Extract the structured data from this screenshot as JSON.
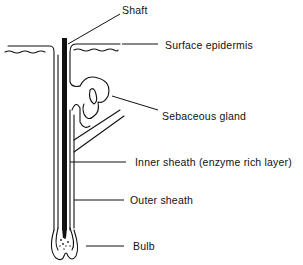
{
  "diagram": {
    "type": "anatomical-cross-section",
    "labels": [
      {
        "id": "shaft",
        "text": "Shaft",
        "x": 122,
        "y": 4
      },
      {
        "id": "surface-epidermis",
        "text": "Surface epidermis",
        "x": 165,
        "y": 39
      },
      {
        "id": "sebaceous-gland",
        "text": "Sebaceous gland",
        "x": 162,
        "y": 110
      },
      {
        "id": "inner-sheath",
        "text": "Inner sheath (enzyme rich layer)",
        "x": 135,
        "y": 155
      },
      {
        "id": "outer-sheath",
        "text": "Outer sheath",
        "x": 130,
        "y": 192
      },
      {
        "id": "bulb",
        "text": "Bulb",
        "x": 133,
        "y": 239
      }
    ],
    "colors": {
      "line": "#111111",
      "background": "#ffffff"
    }
  }
}
